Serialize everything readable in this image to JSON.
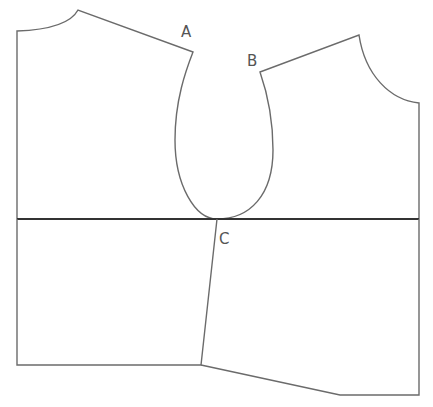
{
  "diagram": {
    "type": "sewing-pattern-bodice",
    "colors": {
      "outline": "#6b6b6b",
      "guide_line": "#333333",
      "label": "#555555",
      "background": "#ffffff"
    },
    "labels": {
      "A": "A",
      "B": "B",
      "C": "C"
    },
    "points": {
      "A": [
        193,
        52
      ],
      "B": [
        260,
        72
      ],
      "C": [
        217,
        219
      ]
    },
    "horizontal_line_y": 219
  }
}
